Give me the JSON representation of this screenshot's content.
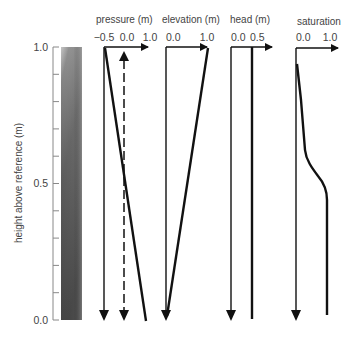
{
  "figure": {
    "y_axis": {
      "label": "height above reference (m)",
      "ticks": [
        "1.0",
        "0.5",
        "0.0"
      ],
      "range": [
        0.0,
        1.0
      ],
      "minor_tick_step": 0.1
    },
    "column": {
      "description": "gradient soil column, light at top, dark at bottom",
      "colors": {
        "top": "#d8d8d8",
        "bottom": "#4a4a4a"
      }
    },
    "panels": [
      {
        "id": "pressure",
        "title": "pressure (m)",
        "ticks": [
          "−0.5",
          "0.0",
          "1.0"
        ],
        "x_range": [
          -0.5,
          1.0
        ],
        "curves": [
          {
            "name": "pressure",
            "style": "solid",
            "points": [
              [
                -0.5,
                1.0
              ],
              [
                1.0,
                0.0
              ]
            ]
          },
          {
            "name": "hydrostatic reference",
            "style": "dashed-double-arrow",
            "x": 0.0
          }
        ]
      },
      {
        "id": "elevation",
        "title": "elevation (m)",
        "ticks": [
          "0.0",
          "1.0"
        ],
        "x_range": [
          0.0,
          1.0
        ],
        "curves": [
          {
            "name": "elevation",
            "style": "solid",
            "points": [
              [
                1.0,
                1.0
              ],
              [
                0.0,
                0.0
              ]
            ]
          }
        ]
      },
      {
        "id": "head",
        "title": "head (m)",
        "ticks": [
          "0.0",
          "0.5"
        ],
        "x_range": [
          0.0,
          0.5
        ],
        "curves": [
          {
            "name": "head",
            "style": "solid",
            "points": [
              [
                0.5,
                1.0
              ],
              [
                0.5,
                0.0
              ]
            ]
          }
        ]
      },
      {
        "id": "saturation",
        "title": "saturation",
        "ticks": [
          "0.0",
          "1.0"
        ],
        "x_range": [
          0.0,
          1.0
        ],
        "curves": [
          {
            "name": "saturation",
            "style": "solid",
            "points": [
              [
                0.0,
                0.99
              ],
              [
                0.1,
                0.8
              ],
              [
                0.18,
                0.63
              ],
              [
                0.45,
                0.56
              ],
              [
                0.75,
                0.51
              ],
              [
                0.75,
                0.0
              ]
            ]
          }
        ]
      }
    ]
  }
}
